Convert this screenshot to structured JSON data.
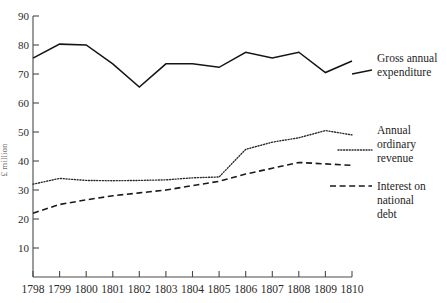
{
  "chart_data": {
    "type": "line",
    "title": "",
    "subtitle": "",
    "xlabel": "",
    "ylabel": "£ million",
    "xlim": [
      1798,
      1810
    ],
    "ylim": [
      0,
      90
    ],
    "grid": false,
    "legend_position": "right-inline",
    "x": [
      1798,
      1799,
      1800,
      1801,
      1802,
      1803,
      1804,
      1805,
      1806,
      1807,
      1808,
      1809,
      1810
    ],
    "xticklabels": [
      "1798",
      "1799",
      "1800",
      "1801",
      "1802",
      "1803",
      "1804",
      "1805",
      "1806",
      "1807",
      "1808",
      "1809",
      "1810"
    ],
    "yticks": [
      0,
      10,
      20,
      30,
      40,
      50,
      60,
      70,
      80,
      90
    ],
    "yticklabels": [
      "0",
      "10",
      "20",
      "30",
      "40",
      "50",
      "60",
      "70",
      "80",
      "90"
    ],
    "series": [
      {
        "name": "Gross annual expenditure",
        "style": "solid",
        "values": [
          75.5,
          80.3,
          80.0,
          73.5,
          65.5,
          73.5,
          73.5,
          72.3,
          77.5,
          75.5,
          77.5,
          70.5,
          74.5
        ]
      },
      {
        "name": "Annual ordinary revenue",
        "style": "dotted",
        "values": [
          32.0,
          34.0,
          33.3,
          33.2,
          33.3,
          33.5,
          34.2,
          34.5,
          44.0,
          46.5,
          48.0,
          50.5,
          49.0
        ]
      },
      {
        "name": "Interest on national debt",
        "style": "dashed",
        "values": [
          22.0,
          25.0,
          26.6,
          28.0,
          29.0,
          30.0,
          31.5,
          33.0,
          35.5,
          37.5,
          39.5,
          39.0,
          38.5
        ]
      }
    ]
  },
  "legend": {
    "items": [
      {
        "lines": [
          "Gross annual",
          "expenditure"
        ]
      },
      {
        "lines": [
          "Annual",
          "ordinary",
          "revenue"
        ]
      },
      {
        "lines": [
          "Interest on",
          "national",
          "debt"
        ]
      }
    ]
  }
}
